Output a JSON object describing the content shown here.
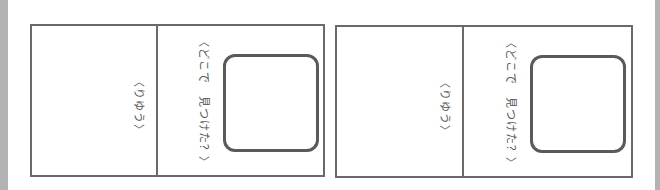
{
  "worksheet": {
    "cards": [
      {
        "prompt_where": "〈どこで　見つけた？〉",
        "prompt_reason": "〈りゆう〉"
      },
      {
        "prompt_where": "〈どこで　見つけた？〉",
        "prompt_reason": "〈りゆう〉"
      }
    ]
  },
  "colors": {
    "border": "#6a6a6a",
    "text": "#555555",
    "edge": "#b3b3b3"
  }
}
